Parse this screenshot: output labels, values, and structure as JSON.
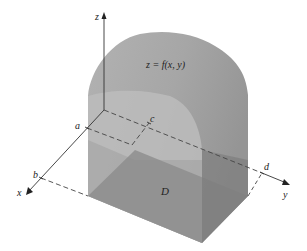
{
  "figure": {
    "surface_label": "z = f(x, y)",
    "region_label": "D",
    "axes": {
      "x": "x",
      "y": "y",
      "z": "z"
    },
    "bounds": {
      "a": "a",
      "b": "b",
      "c": "c",
      "d": "d"
    }
  },
  "colors": {
    "dome_top": "#a9a9a9",
    "dome_front_light": "#bdbdbd",
    "box_left_face": "#b5b5b5",
    "box_front_face": "#8e8e8e",
    "box_right_face": "#7d7d7d",
    "axis": "#333333"
  }
}
